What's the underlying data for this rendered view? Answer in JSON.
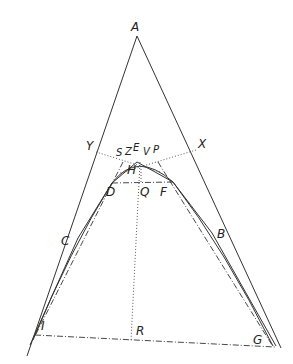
{
  "diagram": {
    "type": "geometric-construction",
    "points": {
      "A": {
        "label": "A",
        "x": 137,
        "y": 36
      },
      "Y": {
        "label": "Y",
        "x": 96,
        "y": 152
      },
      "X": {
        "label": "X",
        "x": 196,
        "y": 150
      },
      "S": {
        "label": "S",
        "x": 122,
        "y": 158
      },
      "Z": {
        "label": "Z",
        "x": 130,
        "y": 157
      },
      "E": {
        "label": "E",
        "x": 137,
        "y": 155
      },
      "V": {
        "label": "V",
        "x": 150,
        "y": 157
      },
      "P": {
        "label": "P",
        "x": 158,
        "y": 156
      },
      "H": {
        "label": "H",
        "x": 140,
        "y": 167
      },
      "D": {
        "label": "D",
        "x": 112,
        "y": 183
      },
      "Q": {
        "label": "Q",
        "x": 141,
        "y": 183
      },
      "F": {
        "label": "F",
        "x": 173,
        "y": 182
      },
      "C": {
        "label": "C",
        "x": 78,
        "y": 238
      },
      "B": {
        "label": "B",
        "x": 212,
        "y": 233
      },
      "I": {
        "label": "I",
        "x": 35,
        "y": 334
      },
      "R": {
        "label": "R",
        "x": 131,
        "y": 341
      },
      "G": {
        "label": "G",
        "x": 270,
        "y": 345
      }
    },
    "labels": [
      "A",
      "Y",
      "X",
      "S",
      "Z",
      "E",
      "V",
      "P",
      "H",
      "D",
      "Q",
      "F",
      "C",
      "B",
      "I",
      "R",
      "G"
    ]
  }
}
